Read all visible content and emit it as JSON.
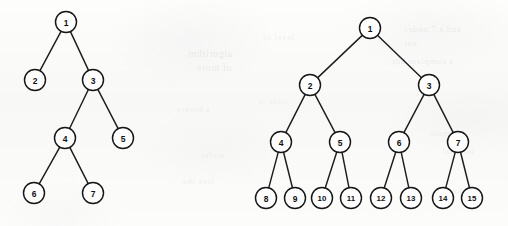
{
  "figure": {
    "width": 508,
    "height": 226,
    "background_color": "#fbfbfa",
    "ink_color": "#161616",
    "node_fill_color": "#fefefe",
    "node_radius": 10.5,
    "node_font_size": 8.5,
    "edge_width": 1.45
  },
  "trees": [
    {
      "id": "left-tree",
      "name": "left-binary-tree",
      "caption": "",
      "node_count": 7,
      "root": "1",
      "nodes": [
        {
          "id": "1",
          "label": "1",
          "cx": 66,
          "cy": 22,
          "depth": 0
        },
        {
          "id": "2",
          "label": "2",
          "cx": 35,
          "cy": 80,
          "depth": 1
        },
        {
          "id": "3",
          "label": "3",
          "cx": 93,
          "cy": 80,
          "depth": 1
        },
        {
          "id": "4",
          "label": "4",
          "cx": 65,
          "cy": 138,
          "depth": 2
        },
        {
          "id": "5",
          "label": "5",
          "cx": 123,
          "cy": 138,
          "depth": 2
        },
        {
          "id": "6",
          "label": "6",
          "cx": 34,
          "cy": 193,
          "depth": 3
        },
        {
          "id": "7",
          "label": "7",
          "cx": 93,
          "cy": 193,
          "depth": 3
        }
      ],
      "edges": [
        {
          "from": "1",
          "to": "2"
        },
        {
          "from": "1",
          "to": "3"
        },
        {
          "from": "3",
          "to": "4"
        },
        {
          "from": "3",
          "to": "5"
        },
        {
          "from": "4",
          "to": "6"
        },
        {
          "from": "4",
          "to": "7"
        }
      ]
    },
    {
      "id": "right-tree",
      "name": "right-binary-tree",
      "caption": "",
      "node_count": 15,
      "root": "1",
      "nodes": [
        {
          "id": "1",
          "label": "1",
          "cx": 370,
          "cy": 28,
          "depth": 0
        },
        {
          "id": "2",
          "label": "2",
          "cx": 310,
          "cy": 85,
          "depth": 1
        },
        {
          "id": "3",
          "label": "3",
          "cx": 429,
          "cy": 85,
          "depth": 1
        },
        {
          "id": "4",
          "label": "4",
          "cx": 281,
          "cy": 142,
          "depth": 2
        },
        {
          "id": "5",
          "label": "5",
          "cx": 340,
          "cy": 142,
          "depth": 2
        },
        {
          "id": "6",
          "label": "6",
          "cx": 399,
          "cy": 142,
          "depth": 2
        },
        {
          "id": "7",
          "label": "7",
          "cx": 458,
          "cy": 142,
          "depth": 2
        },
        {
          "id": "8",
          "label": "8",
          "cx": 266,
          "cy": 198,
          "depth": 3
        },
        {
          "id": "9",
          "label": "9",
          "cx": 295,
          "cy": 198,
          "depth": 3
        },
        {
          "id": "10",
          "label": "10",
          "cx": 322,
          "cy": 198,
          "depth": 3
        },
        {
          "id": "11",
          "label": "11",
          "cx": 351,
          "cy": 198,
          "depth": 3
        },
        {
          "id": "12",
          "label": "12",
          "cx": 381,
          "cy": 198,
          "depth": 3
        },
        {
          "id": "13",
          "label": "13",
          "cx": 411,
          "cy": 198,
          "depth": 3
        },
        {
          "id": "14",
          "label": "14",
          "cx": 443,
          "cy": 198,
          "depth": 3
        },
        {
          "id": "15",
          "label": "15",
          "cx": 472,
          "cy": 198,
          "depth": 3
        }
      ],
      "edges": [
        {
          "from": "1",
          "to": "2"
        },
        {
          "from": "1",
          "to": "3"
        },
        {
          "from": "2",
          "to": "4"
        },
        {
          "from": "2",
          "to": "5"
        },
        {
          "from": "3",
          "to": "6"
        },
        {
          "from": "3",
          "to": "7"
        },
        {
          "from": "4",
          "to": "8"
        },
        {
          "from": "4",
          "to": "9"
        },
        {
          "from": "5",
          "to": "10"
        },
        {
          "from": "5",
          "to": "11"
        },
        {
          "from": "6",
          "to": "12"
        },
        {
          "from": "6",
          "to": "13"
        },
        {
          "from": "7",
          "to": "14"
        },
        {
          "from": "7",
          "to": "15"
        }
      ]
    }
  ],
  "bleed_through": {
    "description": "Faint mirrored ghost text showing through from the reverse side of the scanned page.",
    "marks": [
      {
        "text": "algorithm",
        "x": 188,
        "y": 48,
        "size": 10,
        "opacity": 0.15
      },
      {
        "text": "of more",
        "x": 196,
        "y": 62,
        "size": 10,
        "opacity": 0.13
      },
      {
        "text": "a binary",
        "x": 176,
        "y": 104,
        "size": 9,
        "opacity": 0.11
      },
      {
        "text": "nodes",
        "x": 200,
        "y": 150,
        "size": 9,
        "opacity": 0.1
      },
      {
        "text": "tree the",
        "x": 182,
        "y": 176,
        "size": 9,
        "opacity": 0.1
      },
      {
        "text": "and a 7 nodes",
        "x": 404,
        "y": 24,
        "size": 9,
        "opacity": 0.13
      },
      {
        "text": "ent",
        "x": 404,
        "y": 38,
        "size": 9,
        "opacity": 0.12
      },
      {
        "text": "a complete bin",
        "x": 392,
        "y": 56,
        "size": 9,
        "opacity": 0.12
      },
      {
        "text": "leftmost",
        "x": 430,
        "y": 128,
        "size": 9,
        "opacity": 0.11
      },
      {
        "text": "internal",
        "x": 442,
        "y": 146,
        "size": 9,
        "opacity": 0.11
      },
      {
        "text": "in the",
        "x": 452,
        "y": 186,
        "size": 9,
        "opacity": 0.1
      },
      {
        "text": "level of",
        "x": 262,
        "y": 32,
        "size": 9,
        "opacity": 0.11
      },
      {
        "text": "node is",
        "x": 258,
        "y": 96,
        "size": 9,
        "opacity": 0.09
      }
    ]
  }
}
